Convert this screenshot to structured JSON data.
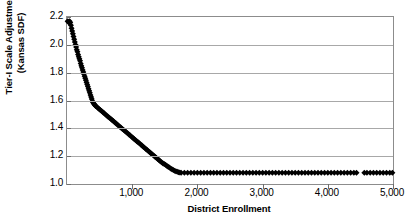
{
  "chart_data": {
    "type": "scatter",
    "title": "",
    "subtitle": "",
    "xlabel": "District Enrollment",
    "ylabel_lines": [
      "Tier-I Scale Adjustment",
      "(Kansas SDF)"
    ],
    "ylabel": "Tier-I Scale Adjustment (Kansas SDF)",
    "xlim": [
      0,
      5000
    ],
    "ylim": [
      1.0,
      2.2
    ],
    "xticks": [
      1000,
      2000,
      3000,
      4000,
      5000
    ],
    "xtick_labels": [
      "1,000",
      "2,000",
      "3,000",
      "4,000",
      "5,000"
    ],
    "yticks": [
      1.0,
      1.2,
      1.4,
      1.6,
      1.8,
      2.0,
      2.2
    ],
    "ytick_labels": [
      "1.0",
      "1.2",
      "1.4",
      "1.6",
      "1.8",
      "2.0",
      "2.2"
    ],
    "grid": "horizontal",
    "legend": "none",
    "marker": "filled-diamond",
    "marker_color": "#000000",
    "marker_size": 3.0,
    "series": [
      {
        "name": "Tier-I Scale Adjustment",
        "notes": "Steep drop from 2.17 to 1.58 over first ~400 students, then near-linear decline to the 1.08 floor at ~1,750 students, then flat floor through 5,000 with a small data gap near 4,480.",
        "points": [
          [
            10,
            2.17
          ],
          [
            20,
            2.165
          ],
          [
            30,
            2.16
          ],
          [
            40,
            2.17
          ],
          [
            50,
            2.16
          ],
          [
            60,
            2.14
          ],
          [
            70,
            2.12
          ],
          [
            80,
            2.1
          ],
          [
            90,
            2.08
          ],
          [
            100,
            2.06
          ],
          [
            110,
            2.04
          ],
          [
            120,
            2.02
          ],
          [
            130,
            2.0
          ],
          [
            140,
            1.985
          ],
          [
            150,
            1.965
          ],
          [
            160,
            1.95
          ],
          [
            170,
            1.93
          ],
          [
            180,
            1.915
          ],
          [
            190,
            1.9
          ],
          [
            200,
            1.885
          ],
          [
            210,
            1.865
          ],
          [
            220,
            1.85
          ],
          [
            230,
            1.835
          ],
          [
            240,
            1.82
          ],
          [
            250,
            1.805
          ],
          [
            260,
            1.79
          ],
          [
            270,
            1.775
          ],
          [
            280,
            1.76
          ],
          [
            290,
            1.745
          ],
          [
            300,
            1.73
          ],
          [
            310,
            1.715
          ],
          [
            320,
            1.7
          ],
          [
            330,
            1.685
          ],
          [
            340,
            1.67
          ],
          [
            350,
            1.655
          ],
          [
            360,
            1.64
          ],
          [
            370,
            1.625
          ],
          [
            380,
            1.61
          ],
          [
            390,
            1.595
          ],
          [
            400,
            1.585
          ],
          [
            410,
            1.578
          ],
          [
            420,
            1.572
          ],
          [
            430,
            1.566
          ],
          [
            440,
            1.56
          ],
          [
            450,
            1.556
          ],
          [
            470,
            1.548
          ],
          [
            490,
            1.54
          ],
          [
            510,
            1.532
          ],
          [
            530,
            1.524
          ],
          [
            550,
            1.516
          ],
          [
            570,
            1.508
          ],
          [
            590,
            1.5
          ],
          [
            610,
            1.492
          ],
          [
            630,
            1.484
          ],
          [
            650,
            1.476
          ],
          [
            670,
            1.468
          ],
          [
            690,
            1.46
          ],
          [
            710,
            1.452
          ],
          [
            730,
            1.444
          ],
          [
            750,
            1.436
          ],
          [
            770,
            1.428
          ],
          [
            790,
            1.42
          ],
          [
            810,
            1.412
          ],
          [
            830,
            1.404
          ],
          [
            850,
            1.396
          ],
          [
            870,
            1.388
          ],
          [
            890,
            1.38
          ],
          [
            910,
            1.372
          ],
          [
            930,
            1.364
          ],
          [
            950,
            1.356
          ],
          [
            970,
            1.348
          ],
          [
            990,
            1.34
          ],
          [
            1010,
            1.332
          ],
          [
            1030,
            1.324
          ],
          [
            1050,
            1.316
          ],
          [
            1070,
            1.308
          ],
          [
            1090,
            1.3
          ],
          [
            1110,
            1.292
          ],
          [
            1130,
            1.284
          ],
          [
            1150,
            1.276
          ],
          [
            1170,
            1.268
          ],
          [
            1190,
            1.26
          ],
          [
            1210,
            1.252
          ],
          [
            1230,
            1.244
          ],
          [
            1250,
            1.236
          ],
          [
            1270,
            1.228
          ],
          [
            1290,
            1.22
          ],
          [
            1310,
            1.212
          ],
          [
            1330,
            1.204
          ],
          [
            1350,
            1.196
          ],
          [
            1370,
            1.188
          ],
          [
            1390,
            1.18
          ],
          [
            1410,
            1.172
          ],
          [
            1430,
            1.164
          ],
          [
            1450,
            1.156
          ],
          [
            1470,
            1.15
          ],
          [
            1490,
            1.144
          ],
          [
            1510,
            1.138
          ],
          [
            1530,
            1.131
          ],
          [
            1550,
            1.124
          ],
          [
            1570,
            1.118
          ],
          [
            1590,
            1.112
          ],
          [
            1610,
            1.106
          ],
          [
            1630,
            1.1
          ],
          [
            1650,
            1.095
          ],
          [
            1670,
            1.091
          ],
          [
            1690,
            1.088
          ],
          [
            1710,
            1.085
          ],
          [
            1730,
            1.082
          ],
          [
            1750,
            1.08
          ],
          [
            1800,
            1.08
          ],
          [
            1850,
            1.08
          ],
          [
            1900,
            1.08
          ],
          [
            1950,
            1.08
          ],
          [
            2000,
            1.08
          ],
          [
            2050,
            1.08
          ],
          [
            2100,
            1.08
          ],
          [
            2150,
            1.08
          ],
          [
            2200,
            1.08
          ],
          [
            2250,
            1.08
          ],
          [
            2300,
            1.08
          ],
          [
            2350,
            1.08
          ],
          [
            2400,
            1.08
          ],
          [
            2450,
            1.08
          ],
          [
            2500,
            1.08
          ],
          [
            2550,
            1.08
          ],
          [
            2600,
            1.08
          ],
          [
            2650,
            1.08
          ],
          [
            2700,
            1.08
          ],
          [
            2750,
            1.08
          ],
          [
            2800,
            1.08
          ],
          [
            2850,
            1.08
          ],
          [
            2900,
            1.08
          ],
          [
            2950,
            1.08
          ],
          [
            3000,
            1.08
          ],
          [
            3050,
            1.08
          ],
          [
            3100,
            1.08
          ],
          [
            3150,
            1.08
          ],
          [
            3200,
            1.08
          ],
          [
            3250,
            1.08
          ],
          [
            3300,
            1.08
          ],
          [
            3350,
            1.08
          ],
          [
            3400,
            1.08
          ],
          [
            3450,
            1.08
          ],
          [
            3500,
            1.08
          ],
          [
            3550,
            1.08
          ],
          [
            3600,
            1.08
          ],
          [
            3650,
            1.08
          ],
          [
            3700,
            1.08
          ],
          [
            3750,
            1.08
          ],
          [
            3800,
            1.08
          ],
          [
            3850,
            1.08
          ],
          [
            3900,
            1.08
          ],
          [
            3950,
            1.08
          ],
          [
            4000,
            1.08
          ],
          [
            4050,
            1.08
          ],
          [
            4100,
            1.08
          ],
          [
            4150,
            1.08
          ],
          [
            4200,
            1.08
          ],
          [
            4250,
            1.08
          ],
          [
            4300,
            1.08
          ],
          [
            4350,
            1.08
          ],
          [
            4400,
            1.08
          ],
          [
            4440,
            1.08
          ],
          [
            4560,
            1.08
          ],
          [
            4600,
            1.08
          ],
          [
            4650,
            1.08
          ],
          [
            4700,
            1.08
          ],
          [
            4750,
            1.08
          ],
          [
            4800,
            1.08
          ],
          [
            4850,
            1.08
          ],
          [
            4900,
            1.08
          ],
          [
            4950,
            1.08
          ],
          [
            4990,
            1.08
          ]
        ]
      }
    ]
  }
}
